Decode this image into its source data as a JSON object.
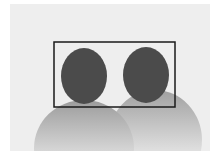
{
  "figure": {
    "description": "Two person silhouettes with a detection bounding box around both heads",
    "colors": {
      "page_background": "#ffffff",
      "panel_background": "#eeeeee",
      "head_fill": "#4b4b4b",
      "body_top": "#9a9a9a",
      "body_bottom": "#eeeeee",
      "box_stroke": "#1a1a1a"
    },
    "people": [
      {
        "name": "person-left",
        "head": {
          "cx": 84,
          "cy": 76,
          "rx": 23,
          "ry": 28
        },
        "body": {
          "cx": 84,
          "cy": 148,
          "rx": 50,
          "ry": 48
        }
      },
      {
        "name": "person-right",
        "head": {
          "cx": 146,
          "cy": 75,
          "rx": 23,
          "ry": 28
        },
        "body": {
          "cx": 155,
          "cy": 140,
          "rx": 47,
          "ry": 50
        }
      }
    ],
    "bounding_box": {
      "x": 54,
      "y": 42,
      "width": 121,
      "height": 65,
      "stroke_width": 1.5
    }
  }
}
